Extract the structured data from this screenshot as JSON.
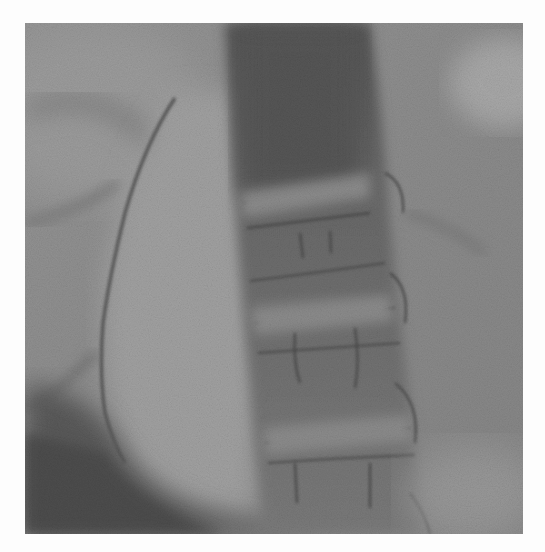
{
  "image": {
    "alt": "Grayscale fluoroscopic radiograph of the lumbar spine with a curved contrast-outlined structure on the left side",
    "modality": "X-ray / fluoroscopy",
    "colors": {
      "background": "#8e8e8e",
      "spine_dark": "#5f5f5f",
      "soft_tissue_light": "#a3a3a3",
      "dark_corner": "#4f4f4f",
      "page": "#fdfdfd"
    },
    "bounds": {
      "x": 25,
      "y": 23,
      "width": 498,
      "height": 511
    }
  }
}
